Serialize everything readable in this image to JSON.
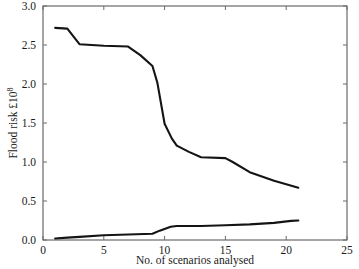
{
  "chart_data": {
    "type": "line",
    "title": "",
    "xlabel": "No. of scenarios analysed",
    "ylabel": "Flood risk £10",
    "ylabel_exponent": "8",
    "xlim": [
      0,
      25
    ],
    "ylim": [
      0.0,
      3.0
    ],
    "grid": false,
    "legend_position": "none",
    "xticks": [
      "0",
      "5",
      "10",
      "15",
      "20",
      "25"
    ],
    "xtick_values": [
      0,
      5,
      10,
      15,
      20,
      25
    ],
    "yticks": [
      "0.0",
      "0.5",
      "1.0",
      "1.5",
      "2.0",
      "2.5",
      "3.0"
    ],
    "ytick_values": [
      0.0,
      0.5,
      1.0,
      1.5,
      2.0,
      2.5,
      3.0
    ],
    "series": [
      {
        "name": "Upper bound flood risk",
        "x": [
          1.0,
          2.0,
          3.0,
          5.0,
          7.0,
          8.0,
          9.0,
          9.4,
          10.0,
          10.6,
          11.0,
          12.0,
          13.0,
          15.0,
          15.6,
          17.0,
          19.0,
          21.0
        ],
        "values": [
          2.72,
          2.71,
          2.51,
          2.49,
          2.48,
          2.37,
          2.23,
          2.02,
          1.49,
          1.3,
          1.21,
          1.13,
          1.06,
          1.05,
          1.0,
          0.87,
          0.76,
          0.67
        ]
      },
      {
        "name": "Lower bound flood risk",
        "x": [
          1.0,
          2.0,
          3.0,
          5.0,
          7.0,
          9.0,
          9.6,
          10.5,
          11.0,
          13.0,
          15.0,
          17.0,
          19.0,
          20.4,
          21.0
        ],
        "values": [
          0.02,
          0.03,
          0.04,
          0.06,
          0.07,
          0.08,
          0.12,
          0.17,
          0.18,
          0.18,
          0.19,
          0.2,
          0.22,
          0.245,
          0.25
        ]
      }
    ],
    "axis_color": "#4d4d4d",
    "line_color": "#141414"
  },
  "geometry": {
    "plot_left": 43,
    "plot_right": 347,
    "plot_top": 6,
    "plot_bottom": 240
  }
}
